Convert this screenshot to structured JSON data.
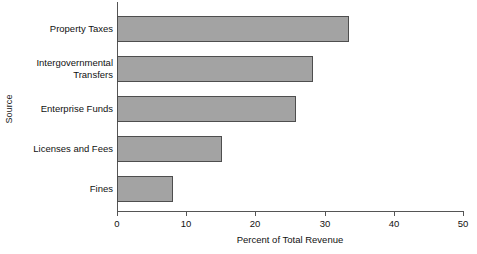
{
  "chart_data": {
    "type": "bar",
    "orientation": "horizontal",
    "title": "",
    "xlabel": "Percent of Total Revenue",
    "ylabel": "Source",
    "categories": [
      "Property Taxes",
      "Intergovernmental\nTransfers",
      "Enterprise Funds",
      "Licenses and Fees",
      "Fines"
    ],
    "values": [
      33.5,
      28.3,
      25.9,
      15.2,
      8.1
    ],
    "xlim": [
      0,
      50
    ],
    "xticks": [
      0,
      10,
      20,
      30,
      40,
      50
    ],
    "xticklabels": [
      "0",
      "10",
      "20",
      "30",
      "40",
      "50"
    ],
    "grid": false,
    "legend": null,
    "bar_fill_color": "#a3a3a3",
    "bar_edge_color": "#4e4e4e",
    "axis_color": "#555555",
    "background_color": "#ffffff"
  }
}
